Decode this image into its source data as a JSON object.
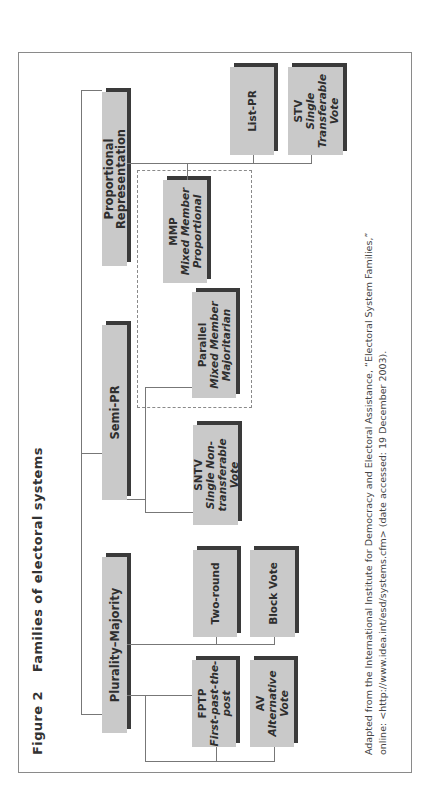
{
  "figure": {
    "number": "Figure 2",
    "title": "Families of electoral systems"
  },
  "families": [
    {
      "id": "plurality-majority",
      "label": "Plurality–Majority",
      "systems": [
        {
          "abbr": "FPTP",
          "name": "First-past-the-post"
        },
        {
          "abbr": "",
          "name": "Two-round"
        },
        {
          "abbr": "AV",
          "name": "Alternative Vote"
        },
        {
          "abbr": "",
          "name": "Block Vote"
        }
      ]
    },
    {
      "id": "semi-pr",
      "label": "Semi-PR",
      "systems": [
        {
          "abbr": "SNTV",
          "name": "Single Non-transferable Vote"
        },
        {
          "abbr": "Parallel",
          "name": "Mixed Member Majoritarian"
        }
      ]
    },
    {
      "id": "proportional-representation",
      "label": "Proportional Representation",
      "systems": [
        {
          "abbr": "MMP",
          "name": "Mixed Member Proportional"
        },
        {
          "abbr": "",
          "name": "List-PR"
        },
        {
          "abbr": "STV",
          "name": "Single Transferable Vote"
        }
      ]
    }
  ],
  "labels": {
    "fptp_abbr": "FPTP",
    "fptp_l1": "First-past-the-",
    "fptp_l2": "post",
    "av_abbr": "AV",
    "av_name": "Alternative Vote",
    "two_round": "Two-round",
    "block_vote": "Block Vote",
    "sntv_abbr": "SNTV",
    "sntv_l1": "Single Non-",
    "sntv_l2": "transferable Vote",
    "parallel_abbr": "Parallel",
    "parallel_l1": "Mixed Member",
    "parallel_l2": "Majoritarian",
    "mmp_abbr": "MMP",
    "mmp_l1": "Mixed Member",
    "mmp_l2": "Proportional",
    "list_pr": "List-PR",
    "stv_abbr": "STV",
    "stv_l1": "Single",
    "stv_l2": "Transferable",
    "stv_l3": "Vote",
    "plurality": "Plurality–Majority",
    "semi_pr": "Semi-PR",
    "pr": "Proportional Representation"
  },
  "caption": {
    "line1": "Adapted from the International Institute for Democracy and Electoral Assistance, “Electoral System Families,”",
    "line2": "online: <http://www.idea.int/esd/systems.cfm> (date accessed: 19 December 2003)."
  }
}
